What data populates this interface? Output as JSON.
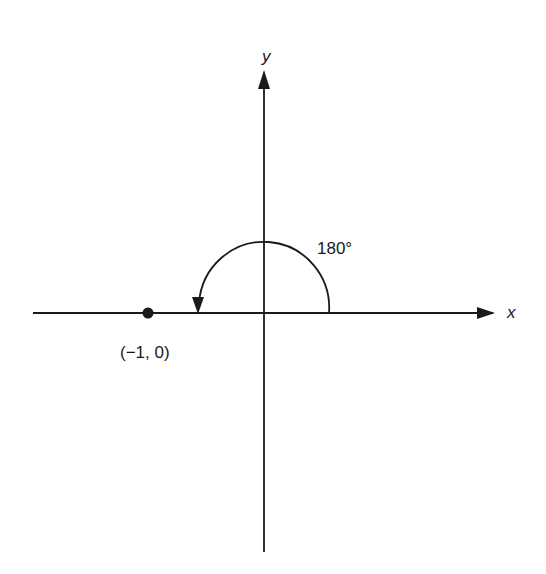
{
  "diagram": {
    "axes": {
      "x_label": "x",
      "y_label": "y",
      "origin": [
        264,
        313
      ]
    },
    "angle": {
      "label": "180°",
      "degrees": 180,
      "direction": "counterclockwise"
    },
    "point": {
      "label": "(−1, 0)",
      "coords": [
        -1,
        0
      ]
    },
    "colors": {
      "ink": "#1a1a1a",
      "background": "#ffffff"
    }
  }
}
